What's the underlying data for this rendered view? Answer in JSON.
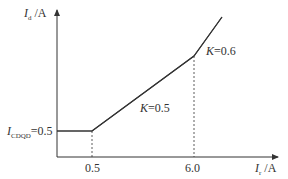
{
  "diagram": {
    "type": "piecewise-linear characteristic",
    "y_axis": {
      "symbol": "I",
      "subscript": "d",
      "unit": " /A"
    },
    "x_axis": {
      "symbol": "I",
      "subscript": "r",
      "unit": " /A"
    },
    "start_label": {
      "symbol": "I",
      "subscript": "CDQD",
      "value": "=0.5"
    },
    "x_ticks": [
      "0.5",
      "6.0"
    ],
    "segments": [
      {
        "name": "flat",
        "from": [
          0,
          0.5
        ],
        "to": [
          0.5,
          0.5
        ]
      },
      {
        "name": "slope-0.5",
        "label": "K=0.5",
        "slope": 0.5
      },
      {
        "name": "slope-0.6",
        "label": "K=0.6",
        "slope": 0.6
      }
    ],
    "slope_labels": {
      "k1": {
        "k": "K",
        "value": "=0.5"
      },
      "k2": {
        "k": "K",
        "value": "=0.6"
      }
    },
    "colors": {
      "line": "#333333",
      "axis": "#333333"
    }
  }
}
